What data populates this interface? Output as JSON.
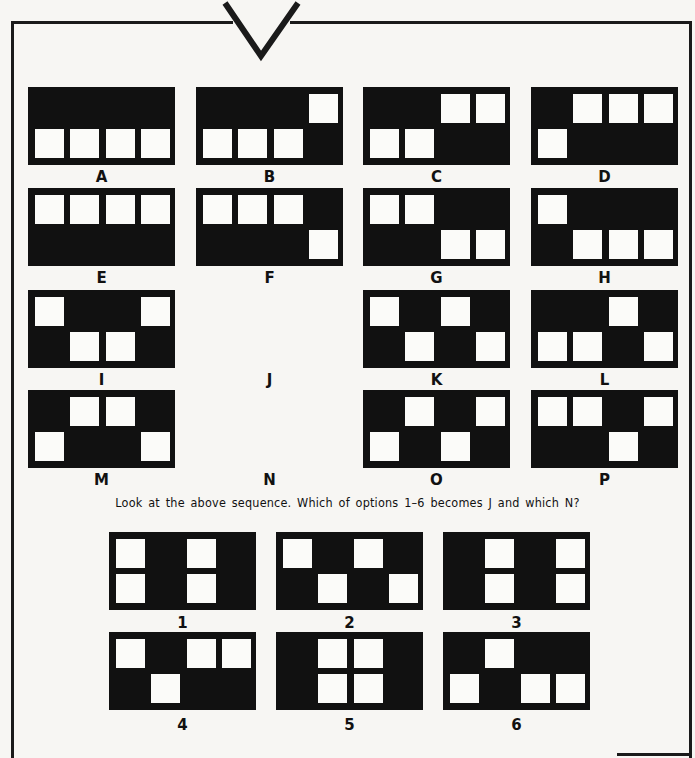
{
  "puzzle": {
    "question": "Look at the above sequence. Which of options  1–6 becomes J and which N?",
    "grid": [
      {
        "label": "A",
        "cells": [
          [
            1,
            0
          ],
          [
            1,
            1
          ],
          [
            1,
            2
          ],
          [
            1,
            3
          ]
        ],
        "empty": false
      },
      {
        "label": "B",
        "cells": [
          [
            0,
            3
          ],
          [
            1,
            0
          ],
          [
            1,
            1
          ],
          [
            1,
            2
          ]
        ],
        "empty": false
      },
      {
        "label": "C",
        "cells": [
          [
            0,
            2
          ],
          [
            0,
            3
          ],
          [
            1,
            0
          ],
          [
            1,
            1
          ]
        ],
        "empty": false
      },
      {
        "label": "D",
        "cells": [
          [
            0,
            1
          ],
          [
            0,
            2
          ],
          [
            0,
            3
          ],
          [
            1,
            0
          ]
        ],
        "empty": false
      },
      {
        "label": "E",
        "cells": [
          [
            0,
            0
          ],
          [
            0,
            1
          ],
          [
            0,
            2
          ],
          [
            0,
            3
          ]
        ],
        "empty": false
      },
      {
        "label": "F",
        "cells": [
          [
            0,
            0
          ],
          [
            0,
            1
          ],
          [
            0,
            2
          ],
          [
            1,
            3
          ]
        ],
        "empty": false
      },
      {
        "label": "G",
        "cells": [
          [
            0,
            0
          ],
          [
            0,
            1
          ],
          [
            1,
            2
          ],
          [
            1,
            3
          ]
        ],
        "empty": false
      },
      {
        "label": "H",
        "cells": [
          [
            0,
            0
          ],
          [
            1,
            1
          ],
          [
            1,
            2
          ],
          [
            1,
            3
          ]
        ],
        "empty": false
      },
      {
        "label": "I",
        "cells": [
          [
            0,
            0
          ],
          [
            0,
            3
          ],
          [
            1,
            1
          ],
          [
            1,
            2
          ]
        ],
        "empty": false
      },
      {
        "label": "J",
        "cells": [],
        "empty": true
      },
      {
        "label": "K",
        "cells": [
          [
            0,
            0
          ],
          [
            0,
            2
          ],
          [
            1,
            1
          ],
          [
            1,
            3
          ]
        ],
        "empty": false
      },
      {
        "label": "L",
        "cells": [
          [
            0,
            2
          ],
          [
            1,
            0
          ],
          [
            1,
            1
          ],
          [
            1,
            3
          ]
        ],
        "empty": false
      },
      {
        "label": "M",
        "cells": [
          [
            0,
            1
          ],
          [
            0,
            2
          ],
          [
            1,
            0
          ],
          [
            1,
            3
          ]
        ],
        "empty": false
      },
      {
        "label": "N",
        "cells": [],
        "empty": true
      },
      {
        "label": "O",
        "cells": [
          [
            0,
            1
          ],
          [
            0,
            3
          ],
          [
            1,
            0
          ],
          [
            1,
            2
          ]
        ],
        "empty": false
      },
      {
        "label": "P",
        "cells": [
          [
            0,
            0
          ],
          [
            0,
            1
          ],
          [
            0,
            3
          ],
          [
            1,
            2
          ]
        ],
        "empty": false
      }
    ],
    "options": [
      {
        "label": "1",
        "cells": [
          [
            0,
            0
          ],
          [
            0,
            2
          ],
          [
            1,
            0
          ],
          [
            1,
            2
          ]
        ]
      },
      {
        "label": "2",
        "cells": [
          [
            0,
            0
          ],
          [
            0,
            2
          ],
          [
            1,
            1
          ],
          [
            1,
            3
          ]
        ]
      },
      {
        "label": "3",
        "cells": [
          [
            0,
            1
          ],
          [
            0,
            3
          ],
          [
            1,
            1
          ],
          [
            1,
            3
          ]
        ]
      },
      {
        "label": "4",
        "cells": [
          [
            0,
            0
          ],
          [
            0,
            2
          ],
          [
            0,
            3
          ],
          [
            1,
            1
          ]
        ]
      },
      {
        "label": "5",
        "cells": [
          [
            0,
            1
          ],
          [
            0,
            2
          ],
          [
            1,
            1
          ],
          [
            1,
            2
          ]
        ]
      },
      {
        "label": "6",
        "cells": [
          [
            0,
            1
          ],
          [
            1,
            0
          ],
          [
            1,
            2
          ],
          [
            1,
            3
          ]
        ]
      }
    ]
  },
  "colors": {
    "panel": "#111111",
    "cell": "#fbfbf9",
    "page": "#f7f6f3"
  }
}
